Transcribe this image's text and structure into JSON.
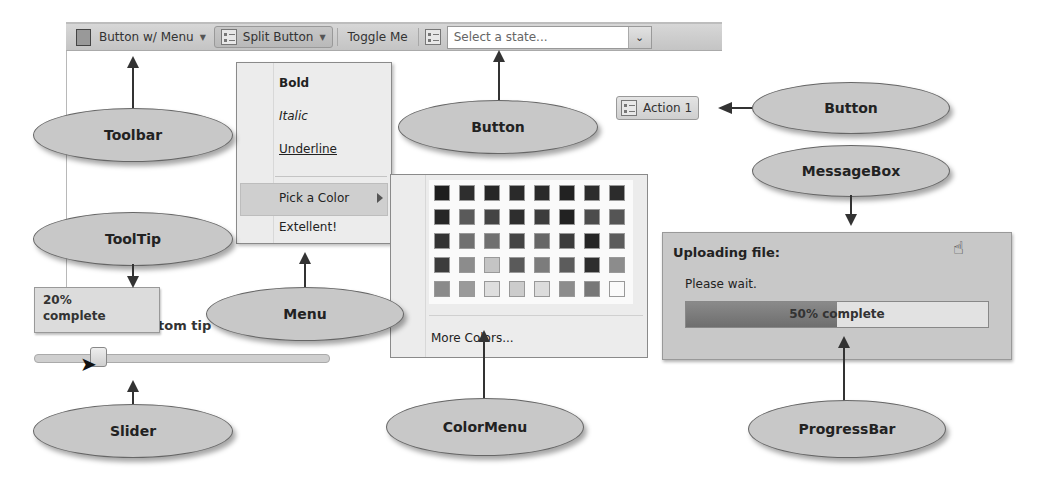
{
  "toolbar": {
    "button_menu_label": "Button w/ Menu",
    "split_button_label": "Split Button",
    "toggle_label": "Toggle Me",
    "combo_placeholder": "Select a state...",
    "icons": {
      "button_menu": "document-icon",
      "split_button": "list-icon",
      "icon_button": "list-icon",
      "combo_arrow": "chevron-down-icon"
    }
  },
  "menu": {
    "items": [
      {
        "label": "Bold",
        "style": "bold"
      },
      {
        "label": "Italic",
        "style": "italic"
      },
      {
        "label": "Underline",
        "style": "underline"
      },
      {
        "label": "Pick a Color",
        "style": "highlighted",
        "submenu": true
      },
      {
        "label": "Extellent!",
        "style": "normal"
      }
    ]
  },
  "color_menu": {
    "rows": [
      [
        "#1e1e1e",
        "#2e2e2e",
        "#262626",
        "#2a2a2a",
        "#2a2a2a",
        "#222222",
        "#2c2c2c",
        "#2c2c2c"
      ],
      [
        "#262626",
        "#5a5a5a",
        "#444444",
        "#2e2e2e",
        "#3c3c3c",
        "#222222",
        "#4c4c4c",
        "#555555"
      ],
      [
        "#333333",
        "#707070",
        "#707070",
        "#444444",
        "#666666",
        "#3c3c3c",
        "#262626",
        "#5c5c5c"
      ],
      [
        "#3c3c3c",
        "#8c8c8c",
        "#c4c4c4",
        "#5a5a5a",
        "#7c7c7c",
        "#5c5c5c",
        "#2e2e2e",
        "#8c8c8c"
      ],
      [
        "#8a8a8a",
        "#9a9a9a",
        "#dedede",
        "#cccccc",
        "#dcdcdc",
        "#8c8c8c",
        "#777777",
        "#fafafa"
      ]
    ],
    "more_label": "More Colors..."
  },
  "action_button": {
    "label": "Action 1",
    "icon": "list-icon"
  },
  "messagebox": {
    "title": "Uploading file:",
    "text": "Please wait.",
    "progress_percent": 50,
    "progress_text": "50% complete"
  },
  "tooltip": {
    "line1": "20%",
    "line2": "complete",
    "underlying_label": "tom tip"
  },
  "slider": {
    "value_percent": 20
  },
  "callouts": {
    "toolbar": "Toolbar",
    "tooltip": "ToolTip",
    "slider": "Slider",
    "menu": "Menu",
    "colormenu": "ColorMenu",
    "button_top": "Button",
    "button_right": "Button",
    "messagebox": "MessageBox",
    "progressbar": "ProgressBar"
  }
}
